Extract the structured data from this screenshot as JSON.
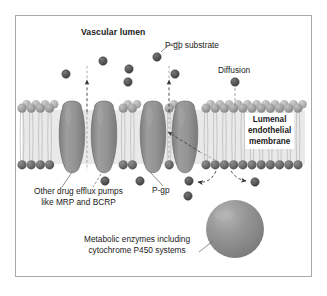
{
  "figure": {
    "frame": {
      "x": 15,
      "y": 15,
      "width": 297,
      "height": 262,
      "border_color": "#a8a8a8"
    },
    "background": "#ffffff"
  },
  "labels": {
    "vascular_lumen": "Vascular lumen",
    "pgp_substrate": "P-gp substrate",
    "diffusion": "Diffusion",
    "lumenal_membrane_line1": "Lumenal",
    "lumenal_membrane_line2": "endothelial",
    "lumenal_membrane_line3": "membrane",
    "other_pumps_line1": "Other drug efflux pumps",
    "other_pumps_line2": "like MRP and BCRP",
    "pgp": "P-gp",
    "metabolic_line1": "Metabolic enzymes including",
    "metabolic_line2": "cytochrome P450 systems"
  },
  "colors": {
    "text": "#1a1a1a",
    "particle_fill": "#5a5a5a",
    "particle_stroke": "#3c3c3c",
    "head_upper": "#9a9a9a",
    "head_lower": "#6e6e6e",
    "tail": "#b9b9b9",
    "pump_fill": "#8e8e8e",
    "pump_stroke": "#6a6a6a",
    "enzyme_sphere": "#8c8c8c",
    "leader_line": "#6a6a6a",
    "dashed_arrow": "#3a3a3a",
    "frame_border": "#a8a8a8"
  },
  "membrane": {
    "top_y": 103,
    "bottom_y": 170,
    "left_x": 22,
    "right_x": 305,
    "head_radius": 4.6,
    "head_spacing": 9.2,
    "leaflets": [
      "upper",
      "lower"
    ],
    "description": "phospholipid bilayer with spherical head groups and hydrocarbon tails"
  },
  "pumps": [
    {
      "name": "efflux-pump-mrp-left",
      "cx": 72,
      "label_ref": "other_pumps"
    },
    {
      "name": "efflux-pump-bcrp-left",
      "cx": 104,
      "label_ref": "other_pumps"
    },
    {
      "name": "efflux-pump-pgp-a",
      "cx": 153,
      "label_ref": "pgp"
    },
    {
      "name": "efflux-pump-pgp-b",
      "cx": 185,
      "label_ref": "pgp"
    }
  ],
  "particles": [
    {
      "name": "substrate-particle",
      "cx": 66,
      "cy": 74,
      "r": 4.2,
      "region": "lumen"
    },
    {
      "name": "substrate-particle",
      "cx": 103,
      "cy": 61,
      "r": 4.2,
      "region": "lumen"
    },
    {
      "name": "substrate-particle",
      "cx": 128,
      "cy": 82,
      "r": 4.2,
      "region": "lumen"
    },
    {
      "name": "substrate-particle",
      "cx": 129,
      "cy": 69,
      "r": 4.2,
      "region": "lumen"
    },
    {
      "name": "substrate-particle-labeled",
      "cx": 157,
      "cy": 57,
      "r": 4.2,
      "region": "lumen"
    },
    {
      "name": "substrate-particle",
      "cx": 175,
      "cy": 74,
      "r": 4.2,
      "region": "lumen"
    },
    {
      "name": "substrate-particle-diffusion",
      "cx": 235,
      "cy": 82,
      "r": 4.2,
      "region": "lumen"
    },
    {
      "name": "substrate-particle",
      "cx": 105,
      "cy": 181,
      "r": 4.2,
      "region": "cytoplasm"
    },
    {
      "name": "substrate-particle",
      "cx": 140,
      "cy": 181,
      "r": 4.2,
      "region": "cytoplasm"
    },
    {
      "name": "substrate-particle",
      "cx": 189,
      "cy": 181,
      "r": 4.2,
      "region": "cytoplasm"
    },
    {
      "name": "substrate-particle",
      "cx": 188,
      "cy": 196,
      "r": 4.2,
      "region": "cytoplasm"
    },
    {
      "name": "substrate-particle",
      "cx": 255,
      "cy": 182,
      "r": 4.2,
      "region": "cytoplasm"
    }
  ],
  "enzyme_sphere": {
    "name": "metabolic-enzyme-sphere",
    "cx": 235,
    "cy": 229,
    "r": 29
  },
  "arrows": [
    {
      "name": "efflux-arrow-left",
      "type": "dashed-vertical-up",
      "x": 87,
      "from_y": 110,
      "to_y": 78
    },
    {
      "name": "efflux-arrow-pgp",
      "type": "dashed-vertical-up",
      "x": 169,
      "from_y": 110,
      "to_y": 78
    },
    {
      "name": "diffusion-arrow",
      "type": "dashed-vertical-down",
      "x": 235,
      "from_y": 88,
      "to_y": 112
    },
    {
      "name": "pgp-uptake-arrow",
      "type": "dashed-diagonal",
      "from_x": 196,
      "from_y": 150,
      "to_x": 166,
      "to_y": 131
    },
    {
      "name": "efflux-curve-left",
      "type": "dashed-curve-left",
      "from_x": 215,
      "from_y": 172,
      "to_x": 197,
      "to_y": 181
    },
    {
      "name": "efflux-curve-right",
      "type": "dashed-curve-right",
      "from_x": 232,
      "from_y": 172,
      "to_x": 248,
      "to_y": 180
    }
  ],
  "leader_lines": [
    {
      "name": "leader-pgp-substrate",
      "from_x": 163,
      "from_y": 50,
      "to_x": 179,
      "to_y": 42
    },
    {
      "name": "leader-other-pumps-a",
      "from_x": 72,
      "from_y": 176,
      "to_x": 62,
      "to_y": 186
    },
    {
      "name": "leader-other-pumps-b",
      "from_x": 100,
      "from_y": 177,
      "to_x": 92,
      "to_y": 186
    },
    {
      "name": "leader-pgp",
      "from_x": 152,
      "from_y": 176,
      "to_x": 161,
      "to_y": 186
    },
    {
      "name": "leader-metabolic",
      "from_x": 214,
      "from_y": 240,
      "to_x": 200,
      "to_y": 251
    }
  ]
}
